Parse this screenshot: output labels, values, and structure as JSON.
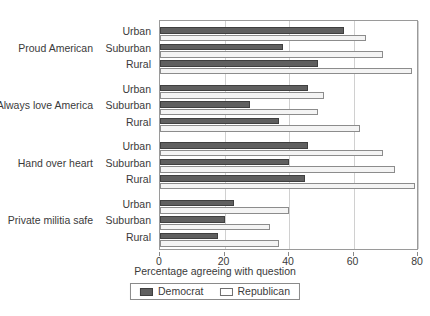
{
  "chart_data": {
    "type": "bar",
    "orientation": "horizontal",
    "title": "",
    "xlabel": "Percentage agreeing with question",
    "ylabel": "",
    "xlim": [
      0,
      80
    ],
    "xticks": [
      0,
      20,
      40,
      60,
      80
    ],
    "xtick_labels": [
      "0",
      "20",
      "40",
      "60",
      "80"
    ],
    "grid": true,
    "grid_axis": "x",
    "legend_position": "bottom",
    "legend": [
      "Democrat",
      "Republican"
    ],
    "series": [
      {
        "name": "Democrat",
        "color": "#5f5f5f"
      },
      {
        "name": "Republican",
        "color": "#f4f4f4"
      }
    ],
    "groups": [
      {
        "category": "Proud American",
        "rows": [
          {
            "label": "Urban",
            "Democrat": 57,
            "Republican": 64
          },
          {
            "label": "Suburban",
            "Democrat": 38,
            "Republican": 69
          },
          {
            "label": "Rural",
            "Democrat": 49,
            "Republican": 78
          }
        ]
      },
      {
        "category": "Always love America",
        "rows": [
          {
            "label": "Urban",
            "Democrat": 46,
            "Republican": 51
          },
          {
            "label": "Suburban",
            "Democrat": 28,
            "Republican": 49
          },
          {
            "label": "Rural",
            "Democrat": 37,
            "Republican": 62
          }
        ]
      },
      {
        "category": "Hand over heart",
        "rows": [
          {
            "label": "Urban",
            "Democrat": 46,
            "Republican": 69
          },
          {
            "label": "Suburban",
            "Democrat": 40,
            "Republican": 73
          },
          {
            "label": "Rural",
            "Democrat": 45,
            "Republican": 79
          }
        ]
      },
      {
        "category": "Private militia safe",
        "rows": [
          {
            "label": "Urban",
            "Democrat": 23,
            "Republican": 40
          },
          {
            "label": "Suburban",
            "Democrat": 20,
            "Republican": 34
          },
          {
            "label": "Rural",
            "Democrat": 18,
            "Republican": 37
          }
        ]
      }
    ]
  }
}
